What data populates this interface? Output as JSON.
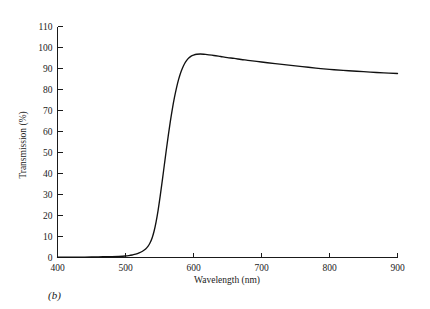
{
  "figure": {
    "caption": "(b)",
    "background_color": "#ffffff",
    "line_color": "#111111"
  },
  "chart_data": {
    "type": "line",
    "title": "",
    "subtitle": "",
    "xlabel": "Wavelength (nm)",
    "ylabel": "Transmission (%)",
    "xlim": [
      400,
      900
    ],
    "ylim": [
      0,
      110
    ],
    "xticks": [
      400,
      500,
      600,
      700,
      800,
      900
    ],
    "yticks": [
      0,
      10,
      20,
      30,
      40,
      50,
      60,
      70,
      80,
      90,
      100,
      110
    ],
    "xtick_labels": [
      "400",
      "500",
      "600",
      "700",
      "800",
      "900"
    ],
    "ytick_labels": [
      "0",
      "10",
      "20",
      "30",
      "40",
      "50",
      "60",
      "70",
      "80",
      "90",
      "100",
      "110"
    ],
    "grid": false,
    "legend": null,
    "annotations": [
      "(b)"
    ],
    "series": [
      {
        "name": "Transmission",
        "color": "#111111",
        "x": [
          400,
          420,
          440,
          460,
          480,
          490,
          500,
          505,
          510,
          515,
          520,
          525,
          530,
          533,
          536,
          539,
          542,
          545,
          548,
          551,
          554,
          557,
          560,
          563,
          566,
          569,
          572,
          575,
          578,
          581,
          584,
          587,
          590,
          593,
          596,
          600,
          605,
          610,
          615,
          620,
          630,
          640,
          650,
          660,
          670,
          680,
          700,
          720,
          740,
          760,
          780,
          800,
          820,
          840,
          860,
          880,
          900
        ],
        "y": [
          0.2,
          0.2,
          0.2,
          0.3,
          0.4,
          0.5,
          0.7,
          0.9,
          1.2,
          1.6,
          2.2,
          3.0,
          4.2,
          5.3,
          6.9,
          9.2,
          12.5,
          17.0,
          22.6,
          29.2,
          36.4,
          43.8,
          51.2,
          58.3,
          64.9,
          70.9,
          76.2,
          80.8,
          84.7,
          87.9,
          90.4,
          92.4,
          93.9,
          95.0,
          95.8,
          96.4,
          96.8,
          96.9,
          96.8,
          96.6,
          96.2,
          95.7,
          95.2,
          94.8,
          94.3,
          93.9,
          93.1,
          92.3,
          91.6,
          90.9,
          90.2,
          89.6,
          89.1,
          88.7,
          88.3,
          87.9,
          87.6
        ]
      }
    ]
  }
}
